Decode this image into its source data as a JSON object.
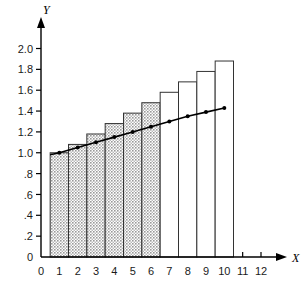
{
  "chart_data": {
    "type": "bar",
    "title": "",
    "subtitle": "",
    "xlabel": "X",
    "ylabel": "Y",
    "xlim": [
      0,
      12.6
    ],
    "ylim": [
      0,
      2.12
    ],
    "grid": false,
    "legend": "none",
    "x_ticks": [
      "0",
      "1",
      "2",
      "3",
      "4",
      "5",
      "6",
      "7",
      "8",
      "9",
      "10",
      "11",
      "12"
    ],
    "x_tick_values": [
      0,
      1,
      2,
      3,
      4,
      5,
      6,
      7,
      8,
      9,
      10,
      11,
      12
    ],
    "y_ticks": [
      "0",
      ".2",
      ".4",
      ".6",
      ".8",
      "1.0",
      "1.2",
      "1.4",
      "1.6",
      "1.8",
      "2.0"
    ],
    "y_tick_values": [
      0,
      0.2,
      0.4,
      0.6,
      0.8,
      1.0,
      1.2,
      1.4,
      1.6,
      1.8,
      2.0
    ],
    "categories": [
      1,
      2,
      3,
      4,
      5,
      6,
      7,
      8,
      9,
      10
    ],
    "values": [
      1.0,
      1.08,
      1.18,
      1.28,
      1.38,
      1.48,
      1.58,
      1.68,
      1.78,
      1.88
    ],
    "bar_width": 1.0,
    "bar_fill_shaded": [
      true,
      true,
      true,
      true,
      true,
      true,
      false,
      false,
      false,
      false
    ],
    "shaded_fill_color": "#c6c6c6",
    "unshaded_fill_color": "#ffffff",
    "bar_edge_color": "#333333",
    "series": [
      {
        "name": "trend-line",
        "type": "line",
        "marker": "dot",
        "color": "#000000",
        "x": [
          0.5,
          1,
          2,
          3,
          4,
          5,
          6,
          7,
          8,
          9,
          10
        ],
        "y": [
          0.98,
          1.0,
          1.05,
          1.1,
          1.15,
          1.2,
          1.25,
          1.3,
          1.35,
          1.39,
          1.43
        ]
      }
    ],
    "annotations": []
  },
  "axes": {
    "y_axis_label": "Y",
    "x_axis_label": "X"
  }
}
